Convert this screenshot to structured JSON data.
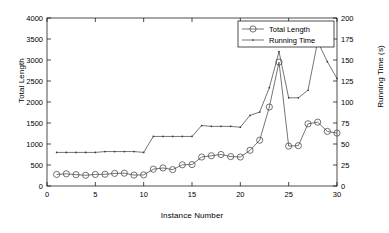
{
  "chart_data": {
    "type": "line",
    "title": "",
    "xlabel": "Instance Number",
    "ylabel": "Total Length",
    "ylabel_right": "Running Time (s)",
    "xlim": [
      0,
      30
    ],
    "ylim": [
      0,
      4000
    ],
    "ylim_right": [
      0,
      200
    ],
    "xticks": [
      0,
      5,
      10,
      15,
      20,
      25,
      30
    ],
    "yticks": [
      0,
      500,
      1000,
      1500,
      2000,
      2500,
      3000,
      3500,
      4000
    ],
    "yticks_right": [
      0,
      25,
      50,
      75,
      100,
      125,
      150,
      175,
      200
    ],
    "grid": false,
    "legend_position": "top-right",
    "x": [
      1,
      2,
      3,
      4,
      5,
      6,
      7,
      8,
      9,
      10,
      11,
      12,
      13,
      14,
      15,
      16,
      17,
      18,
      19,
      20,
      21,
      22,
      23,
      24,
      25,
      26,
      27,
      28,
      29,
      30
    ],
    "series": [
      {
        "name": "Total Length",
        "axis": "left",
        "marker": "circle",
        "color": "#3a3a3a",
        "values": [
          275,
          290,
          270,
          255,
          275,
          280,
          300,
          305,
          260,
          265,
          400,
          430,
          390,
          505,
          510,
          690,
          720,
          750,
          700,
          690,
          850,
          1090,
          1880,
          2950,
          950,
          960,
          1480,
          1520,
          1300,
          1260
        ]
      },
      {
        "name": "Running Time",
        "axis": "right",
        "marker": "dot",
        "color": "#3a3a3a",
        "values": [
          40,
          40,
          40,
          40,
          40,
          41,
          41,
          41,
          41,
          40,
          59,
          59,
          59,
          59,
          59,
          72,
          71,
          71,
          71,
          70,
          84,
          88,
          117,
          160,
          105,
          105,
          114,
          172,
          148,
          128
        ]
      }
    ],
    "legend": [
      {
        "label": "Total Length",
        "marker": "circle"
      },
      {
        "label": "Running Time",
        "marker": "dot"
      }
    ]
  }
}
